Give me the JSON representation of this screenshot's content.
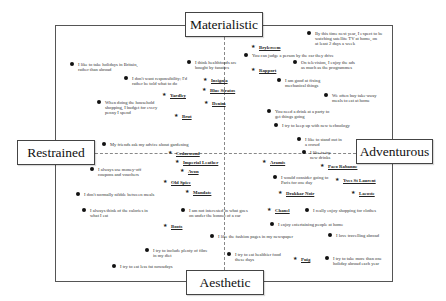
{
  "poles": {
    "top": "Materialistic",
    "bottom": "Aesthetic",
    "left": "Restrained",
    "right": "Adventurous"
  },
  "statements": [
    {
      "id": "s1",
      "text": "By this time next year, I expect to be\nwatching satellite TV at home, on\nat least 2 days a week",
      "x": 315,
      "y": 31
    },
    {
      "id": "s2",
      "text": "You can judge a person by the car they drive",
      "x": 252,
      "y": 53
    },
    {
      "id": "s3",
      "text": "On television, I enjoy the ads\nas much as the programmes",
      "x": 301,
      "y": 60
    },
    {
      "id": "s4",
      "text": "I like to take holidays in Britain,\nrather than abroad",
      "x": 78,
      "y": 62
    },
    {
      "id": "s5",
      "text": "I think healthfoods are\nbought by fanatics",
      "x": 195,
      "y": 60
    },
    {
      "id": "s6",
      "text": "I am good at fixing\nmechanical things",
      "x": 285,
      "y": 78
    },
    {
      "id": "s7",
      "text": "I don't want responsibility; I'd\nrather be told what to do",
      "x": 132,
      "y": 76
    },
    {
      "id": "s8",
      "text": "When doing the household\nshopping, I budget for every\npenny I spend",
      "x": 105,
      "y": 100
    },
    {
      "id": "s9",
      "text": "We often buy take-away\nmeals to eat at home",
      "x": 332,
      "y": 93
    },
    {
      "id": "s10",
      "text": "You need a drink at a party to\nget things going",
      "x": 275,
      "y": 109
    },
    {
      "id": "s11",
      "text": "I try to keep up with new technology",
      "x": 282,
      "y": 123
    },
    {
      "id": "s12",
      "text": "I like to stand out in\na crowd",
      "x": 305,
      "y": 137
    },
    {
      "id": "s13",
      "text": "I like to try\nnew drinks",
      "x": 310,
      "y": 150
    },
    {
      "id": "s14",
      "text": "My friends ask my advice about gardening",
      "x": 110,
      "y": 142
    },
    {
      "id": "s15",
      "text": "I always use money-off\ncoupons and vouchers",
      "x": 98,
      "y": 167
    },
    {
      "id": "s16",
      "text": "I would consider going to\nParis for one day",
      "x": 281,
      "y": 175
    },
    {
      "id": "s17",
      "text": "I don't normally nibble between meals",
      "x": 84,
      "y": 192
    },
    {
      "id": "s18",
      "text": "I always think of the calories in\nwhat I eat",
      "x": 90,
      "y": 208
    },
    {
      "id": "s19",
      "text": "I am not interested in what goes\non under the bonnet of a car",
      "x": 189,
      "y": 208
    },
    {
      "id": "s20",
      "text": "I really enjoy shopping for clothes",
      "x": 313,
      "y": 208
    },
    {
      "id": "s21",
      "text": "I enjoy entertaining people at home",
      "x": 278,
      "y": 222
    },
    {
      "id": "s22",
      "text": "I like the fashion pages in my newspaper",
      "x": 218,
      "y": 234
    },
    {
      "id": "s23",
      "text": "I love travelling abroad",
      "x": 336,
      "y": 233
    },
    {
      "id": "s24",
      "text": "I try to include plenty of fibre\nin my diet",
      "x": 153,
      "y": 248
    },
    {
      "id": "s25",
      "text": "I try to eat healthier food\nthese days",
      "x": 235,
      "y": 252
    },
    {
      "id": "s26",
      "text": "I try to take more than one\nholiday abroad each year",
      "x": 333,
      "y": 256
    },
    {
      "id": "s27",
      "text": "I try to eat less fat nowadays",
      "x": 120,
      "y": 264
    }
  ],
  "brands": [
    {
      "id": "b1",
      "name": "Brylcreem",
      "x": 259,
      "y": 45
    },
    {
      "id": "b2",
      "name": "Rapport",
      "x": 259,
      "y": 68
    },
    {
      "id": "b3",
      "name": "Insignia",
      "x": 211,
      "y": 78
    },
    {
      "id": "b4",
      "name": "Blue Stratos",
      "x": 210,
      "y": 88
    },
    {
      "id": "b5",
      "name": "Yardley",
      "x": 170,
      "y": 93
    },
    {
      "id": "b6",
      "name": "Denim",
      "x": 212,
      "y": 101
    },
    {
      "id": "b7",
      "name": "Brut",
      "x": 182,
      "y": 114
    },
    {
      "id": "b8",
      "name": "Cedarwood",
      "x": 176,
      "y": 151
    },
    {
      "id": "b9",
      "name": "Imperial Leather",
      "x": 183,
      "y": 160
    },
    {
      "id": "b10",
      "name": "Avon",
      "x": 188,
      "y": 169
    },
    {
      "id": "b11",
      "name": "Old Spice",
      "x": 171,
      "y": 180
    },
    {
      "id": "b12",
      "name": "Mandate",
      "x": 193,
      "y": 190
    },
    {
      "id": "b13",
      "name": "Aramis",
      "x": 270,
      "y": 160
    },
    {
      "id": "b14",
      "name": "Paco Rabanne",
      "x": 328,
      "y": 164
    },
    {
      "id": "b15",
      "name": "Yves St Laurent",
      "x": 343,
      "y": 178
    },
    {
      "id": "b16",
      "name": "Drakkar Noir",
      "x": 286,
      "y": 191
    },
    {
      "id": "b17",
      "name": "Lacoste",
      "x": 359,
      "y": 191
    },
    {
      "id": "b18",
      "name": "Chanel",
      "x": 275,
      "y": 208
    },
    {
      "id": "b19",
      "name": "Boots",
      "x": 171,
      "y": 224
    },
    {
      "id": "b20",
      "name": "Puig",
      "x": 301,
      "y": 257
    }
  ]
}
